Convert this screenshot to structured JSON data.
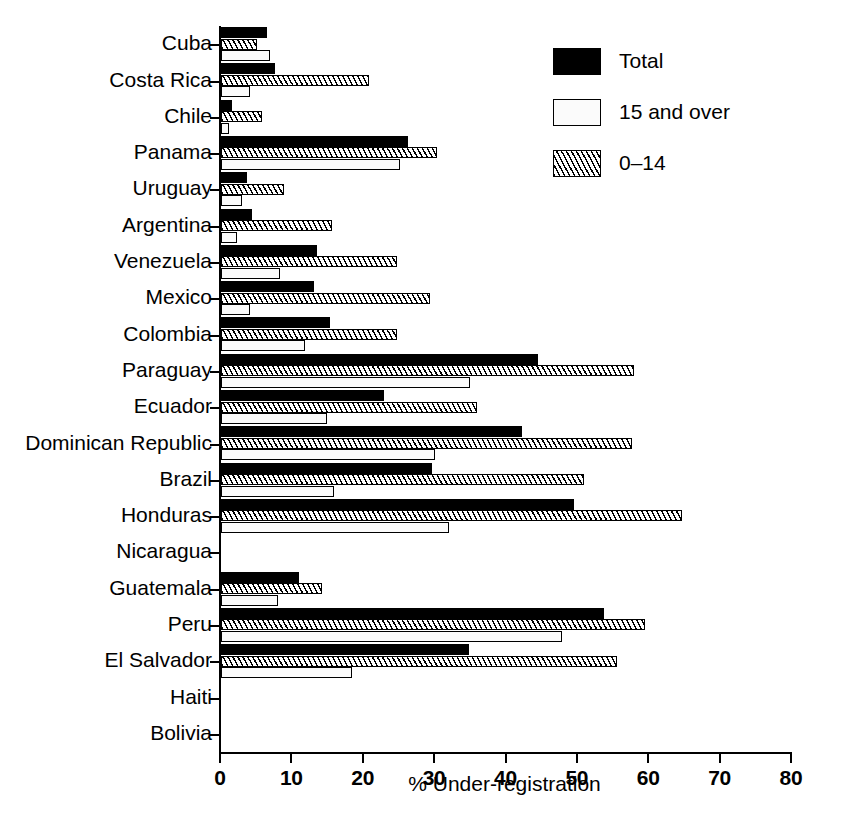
{
  "chart_data": {
    "type": "bar",
    "orientation": "horizontal",
    "title": "",
    "xlabel": "% Under-registration",
    "ylabel": "",
    "xlim": [
      0,
      80
    ],
    "xticks": [
      0,
      10,
      20,
      30,
      40,
      50,
      60,
      70,
      80
    ],
    "grid": false,
    "legend_position": "top-right",
    "categories": [
      "Cuba",
      "Costa Rica",
      "Chile",
      "Panama",
      "Uruguay",
      "Argentina",
      "Venezuela",
      "Mexico",
      "Colombia",
      "Paraguay",
      "Ecuador",
      "Dominican Republic",
      "Brazil",
      "Honduras",
      "Nicaragua",
      "Guatemala",
      "Peru",
      "El Salvador",
      "Haiti",
      "Bolivia"
    ],
    "series": [
      {
        "name": "Total",
        "style": "solid-black",
        "color": "#000000",
        "values": [
          6.4,
          7.6,
          1.5,
          26.2,
          3.6,
          4.3,
          13.4,
          13.0,
          15.3,
          44.4,
          22.8,
          42.2,
          29.6,
          49.4,
          0,
          10.9,
          53.6,
          34.7,
          0,
          0
        ]
      },
      {
        "name": "0–14",
        "style": "diagonal-hatch",
        "color": "#ffffff",
        "values": [
          5.0,
          20.7,
          5.8,
          30.3,
          8.8,
          15.5,
          24.6,
          29.3,
          24.6,
          57.8,
          35.9,
          57.6,
          50.8,
          64.6,
          0,
          14.1,
          59.4,
          55.5,
          0,
          0
        ]
      },
      {
        "name": "15 and over",
        "style": "light-fill",
        "color": "#fbfbfb",
        "values": [
          6.9,
          4.1,
          1.1,
          25.1,
          2.9,
          2.2,
          8.3,
          4.1,
          11.8,
          34.9,
          14.8,
          30.0,
          15.8,
          31.9,
          0,
          8.0,
          47.8,
          18.3,
          0,
          0
        ]
      }
    ]
  },
  "legend": {
    "items": [
      {
        "label": "Total",
        "swatch": "solid-black-swatch"
      },
      {
        "label": "15 and over",
        "swatch": "light-fill-swatch"
      },
      {
        "label": "0–14",
        "swatch": "diagonal-hatch-swatch"
      }
    ]
  },
  "axis": {
    "x_title": "% Under-registration",
    "tick_labels": [
      "0",
      "10",
      "20",
      "30",
      "40",
      "50",
      "60",
      "70",
      "80"
    ]
  }
}
